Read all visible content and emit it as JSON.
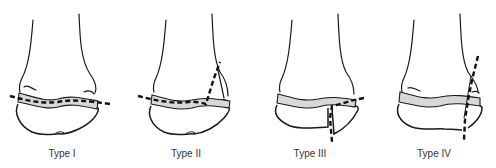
{
  "diagram": {
    "colors": {
      "outline": "#1a1a1a",
      "growth_plate": "#d8d8d8",
      "fracture_line": "#111111",
      "label_text": "#333333"
    },
    "panels": [
      {
        "id": "type-1",
        "label": "Type I",
        "fracture": "through growth plate only"
      },
      {
        "id": "type-2",
        "label": "Type II",
        "fracture": "through growth plate and metaphysis"
      },
      {
        "id": "type-3",
        "label": "Type III",
        "fracture": "through growth plate and epiphysis"
      },
      {
        "id": "type-4",
        "label": "Type IV",
        "fracture": "through metaphysis, growth plate and epiphysis"
      }
    ]
  }
}
